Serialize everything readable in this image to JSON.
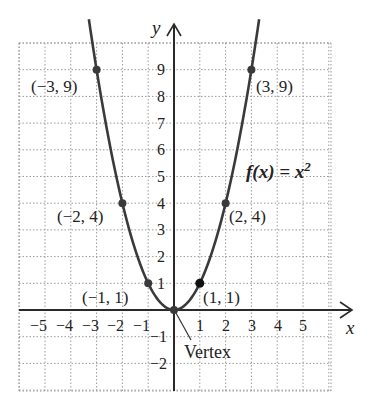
{
  "chart_data": {
    "type": "line",
    "title": "",
    "function_label": "f(x) = x^2",
    "xlabel": "x",
    "ylabel": "y",
    "xlim": [
      -6,
      6
    ],
    "ylim": [
      -3,
      10.3
    ],
    "grid": true,
    "grid_style": "dotted",
    "x_ticks": [
      -5,
      -4,
      -3,
      -2,
      -1,
      1,
      2,
      3,
      4,
      5
    ],
    "y_ticks": [
      -2,
      -1,
      1,
      2,
      3,
      4,
      5,
      6,
      7,
      8,
      9
    ],
    "x_tick_labels": [
      "−5",
      "−4",
      "−3",
      "−2",
      "−1",
      "1",
      "2",
      "3",
      "4",
      "5"
    ],
    "y_tick_labels": [
      "−2",
      "−1",
      "1",
      "2",
      "3",
      "4",
      "5",
      "6",
      "7",
      "8",
      "9"
    ],
    "series": [
      {
        "name": "f(x) = x^2",
        "x_range": [
          -3.3,
          3.3
        ],
        "color": "#3a3a3a"
      }
    ],
    "points": [
      {
        "x": -3,
        "y": 9,
        "label": "(−3, 9)"
      },
      {
        "x": -2,
        "y": 4,
        "label": "(−2, 4)"
      },
      {
        "x": -1,
        "y": 1,
        "label": "(−1, 1)"
      },
      {
        "x": 0,
        "y": 0,
        "label": ""
      },
      {
        "x": 1,
        "y": 1,
        "label": "(1, 1)"
      },
      {
        "x": 2,
        "y": 4,
        "label": "(2, 4)"
      },
      {
        "x": 3,
        "y": 9,
        "label": "(3, 9)"
      }
    ],
    "annotations": [
      {
        "text": "Vertex",
        "points_to": [
          0,
          0
        ]
      }
    ]
  },
  "labels": {
    "y_axis": "y",
    "x_axis": "x",
    "function": "f(x) = x",
    "function_exp": "2",
    "vertex": "Vertex",
    "pt_m3": "(−3, 9)",
    "pt_m2": "(−2, 4)",
    "pt_m1": "(−1, 1)",
    "pt_1": "(1, 1)",
    "pt_2": "(2, 4)",
    "pt_3": "(3, 9)",
    "xt": [
      "−5",
      "−4",
      "−3",
      "−2",
      "−1",
      "1",
      "2",
      "3",
      "4",
      "5"
    ],
    "yt": [
      "9",
      "8",
      "7",
      "6",
      "5",
      "4",
      "3",
      "2",
      "1",
      "−1",
      "−2"
    ]
  }
}
